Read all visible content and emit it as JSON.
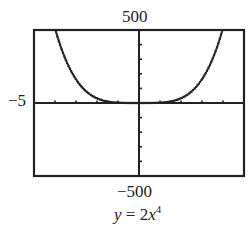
{
  "chart_data": {
    "type": "line",
    "title": "",
    "caption": "y = 2x^4",
    "function": "y = 2x^4",
    "xlim": [
      -5,
      5
    ],
    "ylim": [
      -500,
      500
    ],
    "xtick_step": 1,
    "ytick_step": 100,
    "window_labels": {
      "ymax": "500",
      "ymin": "−500",
      "xmin": "−5"
    },
    "grid": false,
    "legend": null,
    "series": [
      {
        "name": "y = 2x^4",
        "x": [
          -4,
          -3.5,
          -3,
          -2.5,
          -2,
          -1.5,
          -1,
          -0.5,
          0,
          0.5,
          1,
          1.5,
          2,
          2.5,
          3,
          3.5,
          4
        ],
        "values": [
          512,
          300.1,
          162,
          78.1,
          32,
          10.1,
          2,
          0.1,
          0,
          0.1,
          2,
          10.1,
          32,
          78.1,
          162,
          300.1,
          512
        ]
      }
    ],
    "style": {
      "curve": "dotted-pixel",
      "color": "#222222"
    }
  },
  "labels": {
    "ymax": "500",
    "ymin": "−500",
    "xmin": "−5",
    "eq_y": "y",
    "eq_eq": " = ",
    "eq_coef": "2",
    "eq_var": "x",
    "eq_exp": "4"
  }
}
